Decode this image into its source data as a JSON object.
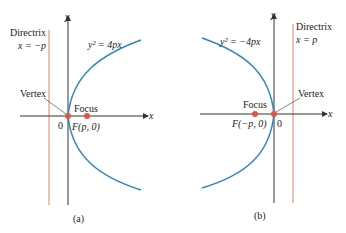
{
  "panels": [
    {
      "id": "a",
      "caption": "(a)",
      "equation": "y² = 4px",
      "directrix_label": "Directrix",
      "directrix_eq": "x = −p",
      "vertex_label": "Vertex",
      "focus_label": "Focus",
      "focus_coords": "F(p, 0)",
      "origin_label": "0",
      "x_axis_label": "x",
      "y_axis_label": "y"
    },
    {
      "id": "b",
      "caption": "(b)",
      "equation": "y² = −4px",
      "directrix_label": "Directrix",
      "directrix_eq": "x = p",
      "vertex_label": "Vertex",
      "focus_label": "Focus",
      "focus_coords": "F(−p, 0)",
      "origin_label": "0",
      "x_axis_label": "x",
      "y_axis_label": "y"
    }
  ],
  "colors": {
    "parabola": "#2e86c1",
    "directrix": "#e0826a",
    "focus_point": "#e2553a",
    "axis": "#333333"
  }
}
